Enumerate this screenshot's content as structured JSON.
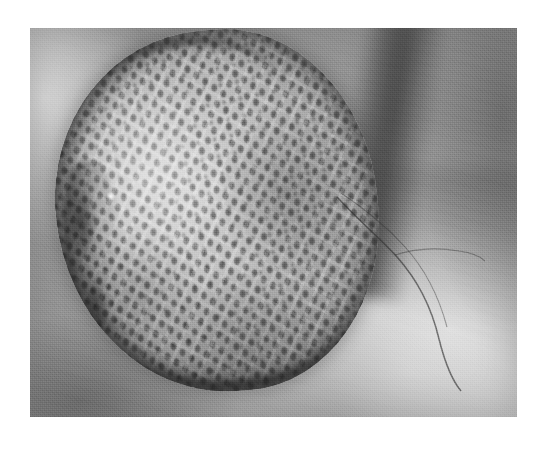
{
  "figure": {
    "domain": "Natural-Image",
    "media_type": "grayscale-photograph",
    "caption": "",
    "page_background": "#ffffff",
    "plate": {
      "name": "photographic-plate",
      "left_px": 30,
      "top_px": 28,
      "width_px": 487,
      "height_px": 389,
      "tone": "monochrome / greyscale",
      "overall_mid_grey": "#a5a5a3",
      "grain": "visible film / halftone print grain",
      "focus": "soft, slightly out of focus"
    },
    "regions": [
      {
        "name": "lesion",
        "description": "large roughly circular raised plaque occupying the left and upper-centre of the frame, covered in a dense net-like lattice of small dark pits",
        "shape": "round to oval, slightly irregular margin",
        "approx_center_px": [
          218,
          211
        ],
        "approx_width_px": 322,
        "approx_height_px": 362,
        "fill_grey": "#c2c2c0",
        "border_grey": "#2d2b29",
        "pattern": "reticular / honeycomb — regular dark dots in a diagonal lattice",
        "dot_spacing_px": 15,
        "dot_color": "#37342f"
      },
      {
        "name": "surrounding-skin",
        "description": "smooth pale skin filling the lower-right half of the frame, gently lit",
        "fill_grey": "#cfcfcd",
        "highlight_grey": "#e4e4e2"
      },
      {
        "name": "dark-fold-band",
        "description": "dark vertical shadowed band / fold running down the upper-right of the frame",
        "fill_grey": "#3c3a38",
        "orientation": "near-vertical, tilted ~9 degrees"
      },
      {
        "name": "corner-shadow-bottom-left",
        "description": "dark shadowed corner at the lower-left of the plate",
        "fill_grey": "#4a4846"
      },
      {
        "name": "hair-thread",
        "description": "single fine dark curving line (hair or thread) crossing the skin to the lower right of the lesion",
        "stroke_grey": "#302e2c"
      },
      {
        "name": "rim-highlight-speck",
        "description": "small bright white speck on the upper-left rim of the lesion",
        "fill_grey": "#f4f4f2"
      }
    ],
    "palette": {
      "paper_white": "#ffffff",
      "highlight": "#e8e8e6",
      "light_grey": "#cfcfcd",
      "mid_grey": "#a5a5a3",
      "dark_grey": "#6a6866",
      "shadow": "#3c3a38",
      "darkest": "#232220"
    }
  }
}
